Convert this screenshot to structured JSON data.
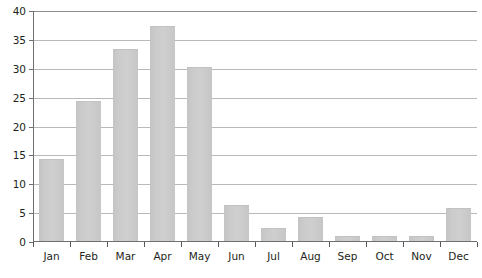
{
  "chart_data": {
    "type": "bar",
    "title": "",
    "subtitle": "",
    "xlabel": "",
    "ylabel": "",
    "categories": [
      "Jan",
      "Feb",
      "Mar",
      "Apr",
      "May",
      "Jun",
      "Jul",
      "Aug",
      "Sep",
      "Oct",
      "Nov",
      "Dec"
    ],
    "values": [
      14,
      24,
      33,
      37,
      30,
      6,
      2,
      4,
      0.7,
      0.7,
      0.7,
      5.5
    ],
    "ylim": [
      0,
      40
    ],
    "ytick_values": [
      0,
      5,
      10,
      15,
      20,
      25,
      30,
      35,
      40
    ],
    "ytick_labels": [
      "0",
      "5",
      "10",
      "15",
      "20",
      "25",
      "30",
      "35",
      "40"
    ],
    "grid": true,
    "grid_axis": "y",
    "legend": false,
    "legend_position": "none",
    "annotations": [],
    "colors": {
      "bar_fill": "#cbcbcb",
      "bar_edge": "#c2c2c2",
      "gridline": "#b9b9b9",
      "axis_line": "#6f6f6f",
      "top_line": "#8d8d8d",
      "tick_mark": "#55595c",
      "label_text": "#231f20",
      "background": "#ffffff"
    }
  }
}
